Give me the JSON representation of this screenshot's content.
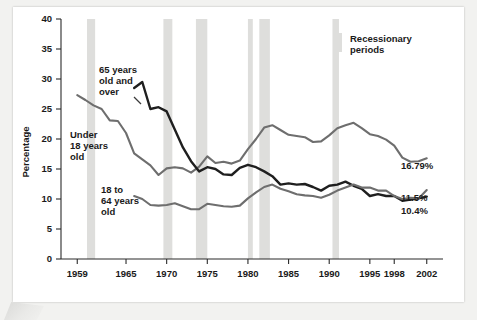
{
  "chart_data": {
    "type": "line",
    "title": "",
    "xlabel": "",
    "ylabel": "Percentage",
    "xlim": [
      1957,
      2004
    ],
    "ylim": [
      0,
      40
    ],
    "yticks": [
      0,
      5,
      10,
      15,
      20,
      25,
      30,
      35,
      40
    ],
    "xticks": [
      1959,
      1965,
      1970,
      1975,
      1980,
      1985,
      1990,
      1995,
      1998,
      2002
    ],
    "xtick_labels": [
      "1959",
      "1965",
      "1970",
      "1975",
      "1980",
      "1985",
      "1990",
      "1995",
      "1998",
      "2002"
    ],
    "ytick_labels": [
      "0",
      "5",
      "10",
      "15",
      "20",
      "25",
      "30",
      "35",
      "40"
    ],
    "grid": false,
    "legend_position": "top-right",
    "legend": [
      {
        "label": "Recessionary periods",
        "swatch_color": "#dededc",
        "type": "band"
      }
    ],
    "series": [
      {
        "name": "Under 18 years old",
        "color": "#6e6e6e",
        "stroke_width": 2.1,
        "end_label": "16.79%",
        "annotation": "Under\n18 years\nold",
        "x": [
          1959,
          1960,
          1961,
          1962,
          1963,
          1964,
          1965,
          1966,
          1967,
          1968,
          1969,
          1970,
          1971,
          1972,
          1973,
          1974,
          1975,
          1976,
          1977,
          1978,
          1979,
          1980,
          1981,
          1982,
          1983,
          1984,
          1985,
          1986,
          1987,
          1988,
          1989,
          1990,
          1991,
          1992,
          1993,
          1994,
          1995,
          1996,
          1997,
          1998,
          1999,
          2000,
          2001,
          2002
        ],
        "y": [
          27.3,
          26.5,
          25.6,
          25.0,
          23.1,
          23.0,
          21.0,
          17.6,
          16.6,
          15.6,
          14.0,
          15.1,
          15.3,
          15.1,
          14.4,
          15.4,
          17.1,
          16.0,
          16.2,
          15.9,
          16.4,
          18.3,
          20.0,
          21.9,
          22.3,
          21.5,
          20.7,
          20.5,
          20.3,
          19.5,
          19.6,
          20.6,
          21.8,
          22.3,
          22.7,
          21.8,
          20.8,
          20.5,
          19.9,
          18.9,
          16.9,
          16.2,
          16.3,
          16.79
        ]
      },
      {
        "name": "65 years old and over",
        "color": "#1f1f1f",
        "stroke_width": 2.4,
        "end_label": "10.4%",
        "annotation": "65 years\nold and\nover",
        "x": [
          1966,
          1967,
          1968,
          1969,
          1970,
          1971,
          1972,
          1973,
          1974,
          1975,
          1976,
          1977,
          1978,
          1979,
          1980,
          1981,
          1982,
          1983,
          1984,
          1985,
          1986,
          1987,
          1988,
          1989,
          1990,
          1991,
          1992,
          1993,
          1994,
          1995,
          1996,
          1997,
          1998,
          1999,
          2000,
          2001,
          2002
        ],
        "y": [
          28.5,
          29.5,
          25.0,
          25.3,
          24.6,
          21.6,
          18.6,
          16.3,
          14.6,
          15.3,
          15.0,
          14.1,
          14.0,
          15.2,
          15.7,
          15.3,
          14.6,
          13.8,
          12.4,
          12.6,
          12.4,
          12.5,
          12.0,
          11.4,
          12.2,
          12.4,
          12.9,
          12.2,
          11.7,
          10.5,
          10.8,
          10.5,
          10.5,
          9.7,
          9.9,
          10.1,
          10.4
        ]
      },
      {
        "name": "18 to 64 years old",
        "color": "#6e6e6e",
        "stroke_width": 2.1,
        "end_label": "11.5%",
        "annotation": "18 to\n64 years\nold",
        "x": [
          1966,
          1967,
          1968,
          1969,
          1970,
          1971,
          1972,
          1973,
          1974,
          1975,
          1976,
          1977,
          1978,
          1979,
          1980,
          1981,
          1982,
          1983,
          1984,
          1985,
          1986,
          1987,
          1988,
          1989,
          1990,
          1991,
          1992,
          1993,
          1994,
          1995,
          1996,
          1997,
          1998,
          1999,
          2000,
          2001,
          2002
        ],
        "y": [
          10.5,
          10.0,
          9.0,
          8.9,
          9.0,
          9.3,
          8.8,
          8.3,
          8.3,
          9.2,
          9.0,
          8.8,
          8.7,
          8.9,
          10.1,
          11.1,
          12.0,
          12.4,
          11.7,
          11.3,
          10.8,
          10.6,
          10.5,
          10.2,
          10.7,
          11.4,
          11.9,
          12.4,
          11.9,
          11.9,
          11.4,
          11.4,
          10.5,
          10.0,
          10.2,
          10.1,
          11.5
        ]
      }
    ],
    "recession_bands": [
      {
        "start": 1960.2,
        "end": 1961.2
      },
      {
        "start": 1969.6,
        "end": 1970.7
      },
      {
        "start": 1973.6,
        "end": 1975.0
      },
      {
        "start": 1980.0,
        "end": 1980.6
      },
      {
        "start": 1981.4,
        "end": 1982.7
      },
      {
        "start": 1990.4,
        "end": 1991.2
      }
    ]
  },
  "annotations": {
    "under18": {
      "line1": "Under",
      "line2": "18 years",
      "line3": "old"
    },
    "over65": {
      "line1": "65 years",
      "line2": "old and",
      "line3": "over"
    },
    "adults": {
      "line1": "18 to",
      "line2": "64 years",
      "line3": "old"
    }
  },
  "legend": {
    "line1": "Recessionary",
    "line2": "periods"
  },
  "end_labels": {
    "under18": "16.79%",
    "adults": "11.5%",
    "over65": "10.4%"
  },
  "axis": {
    "ylabel": "Percentage"
  }
}
